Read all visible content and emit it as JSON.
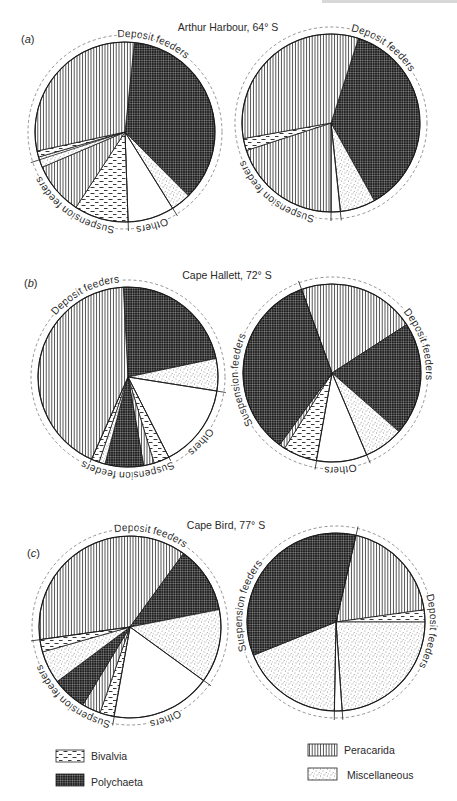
{
  "figure": {
    "panels": [
      {
        "id": "a",
        "label": {
          "open": "(",
          "letter": "a",
          "close": ")"
        },
        "title": "Arthur Harbour, 64° S"
      },
      {
        "id": "b",
        "label": {
          "open": "(",
          "letter": "b",
          "close": ")"
        },
        "title": "Cape Hallett, 72° S"
      },
      {
        "id": "c",
        "label": {
          "open": "(",
          "letter": "c",
          "close": ")"
        },
        "title": "Cape Bird, 77° S"
      }
    ]
  },
  "legend": {
    "items": [
      {
        "category": "Bivalvia",
        "label": "Bivalvia",
        "pattern": "dashes"
      },
      {
        "category": "Polychaeta",
        "label": "Polychaeta",
        "pattern": "dark-crosshatch"
      },
      {
        "category": "Peracarida",
        "label": "Peracarida",
        "pattern": "vertical-lines"
      },
      {
        "category": "Miscellaneous",
        "label": "Miscellaneous",
        "pattern": "stipple"
      }
    ],
    "unlabeled_categories": [
      {
        "category": "Others",
        "pattern": "blank"
      }
    ]
  },
  "chart_data": [
    {
      "type": "pie",
      "panel": "a",
      "title": "Arthur Harbour, 64° S",
      "legend": [
        "Bivalvia",
        "Polychaeta",
        "Peracarida",
        "Miscellaneous"
      ],
      "pies": [
        {
          "id": "a-left",
          "center": [
            125,
            132
          ],
          "radius": 90,
          "start_angle_deg": 6,
          "slices": [
            {
              "category": "Polychaeta",
              "value": 35.8
            },
            {
              "category": "Miscellaneous",
              "value": 3.6
            },
            {
              "category": "Others",
              "value": 8.3
            },
            {
              "category": "Bivalvia",
              "value": 9.7
            },
            {
              "category": "Peracarida",
              "value": 9.4
            },
            {
              "category": "Miscellaneous",
              "value": 1.9
            },
            {
              "category": "Bivalvia",
              "value": 1.1
            },
            {
              "category": "Peracarida",
              "value": 30.0
            }
          ],
          "group_labels": [
            {
              "text": "Deposit feeders",
              "mid_angle_deg": 17
            },
            {
              "text": "Others",
              "mid_angle_deg": 163
            },
            {
              "text": "Suspension feeders",
              "mid_angle_deg": 214
            }
          ],
          "dividers_deg": [
            148,
            178,
            252
          ]
        },
        {
          "id": "a-right",
          "center": [
            331,
            123
          ],
          "radius": 89,
          "start_angle_deg": 18,
          "slices": [
            {
              "category": "Polychaeta",
              "value": 36.9
            },
            {
              "category": "Miscellaneous",
              "value": 6.4
            },
            {
              "category": "Others",
              "value": 1.7
            },
            {
              "category": "Peracarida",
              "value": 20.0
            },
            {
              "category": "Bivalvia",
              "value": 2.2
            },
            {
              "category": "Peracarida",
              "value": 32.8
            }
          ],
          "group_labels": [
            {
              "text": "Deposit feeders",
              "mid_angle_deg": 34
            },
            {
              "text": "Suspension feeders",
              "mid_angle_deg": 218
            }
          ],
          "dividers_deg": [
            174,
            180
          ]
        }
      ]
    },
    {
      "type": "pie",
      "panel": "b",
      "title": "Cape Hallett, 72° S",
      "legend": [
        "Bivalvia",
        "Polychaeta",
        "Peracarida",
        "Miscellaneous"
      ],
      "pies": [
        {
          "id": "b-left",
          "center": [
            128,
            377
          ],
          "radius": 90,
          "start_angle_deg": -3,
          "slices": [
            {
              "category": "Polychaeta",
              "value": 22.5
            },
            {
              "category": "Miscellaneous",
              "value": 5.8
            },
            {
              "category": "Others",
              "value": 15.0
            },
            {
              "category": "Bivalvia",
              "value": 2.8
            },
            {
              "category": "Peracarida",
              "value": 1.9
            },
            {
              "category": "Polychaeta",
              "value": 6.9
            },
            {
              "category": "Miscellaneous",
              "value": 1.1
            },
            {
              "category": "Bivalvia",
              "value": 1.4
            },
            {
              "category": "Peracarida",
              "value": 42.5
            }
          ],
          "group_labels": [
            {
              "text": "Deposit feeders",
              "mid_angle_deg": 332
            },
            {
              "text": "Others",
              "mid_angle_deg": 131
            },
            {
              "text": "Suspension feeders",
              "mid_angle_deg": 180
            }
          ],
          "dividers_deg": [
            99,
            153,
            204
          ]
        },
        {
          "id": "b-right",
          "center": [
            332,
            373
          ],
          "radius": 89,
          "start_angle_deg": -20,
          "slices": [
            {
              "category": "Peracarida",
              "value": 21.4
            },
            {
              "category": "Polychaeta",
              "value": 20.6
            },
            {
              "category": "Miscellaneous",
              "value": 7.2
            },
            {
              "category": "Others",
              "value": 9.2
            },
            {
              "category": "Bivalvia",
              "value": 6.1
            },
            {
              "category": "Peracarida",
              "value": 1.1
            },
            {
              "category": "Polychaeta",
              "value": 34.4
            }
          ],
          "group_labels": [
            {
              "text": "Deposit feeders",
              "mid_angle_deg": 71
            },
            {
              "text": "Others",
              "mid_angle_deg": 174
            },
            {
              "text": "Suspension feeders",
              "mid_angle_deg": 265
            }
          ],
          "dividers_deg": [
            -20,
            157,
            190
          ]
        }
      ]
    },
    {
      "type": "pie",
      "panel": "c",
      "title": "Cape Bird, 77° S",
      "legend": [
        "Bivalvia",
        "Polychaeta",
        "Peracarida",
        "Miscellaneous"
      ],
      "pies": [
        {
          "id": "c-left",
          "center": [
            130,
            627
          ],
          "radius": 91,
          "start_angle_deg": -98,
          "slices": [
            {
              "category": "Peracarida",
              "value": 37.2
            },
            {
              "category": "Polychaeta",
              "value": 11.9
            },
            {
              "category": "Miscellaneous",
              "value": 13.1
            },
            {
              "category": "Others",
              "value": 17.8
            },
            {
              "category": "Bivalvia",
              "value": 2.5
            },
            {
              "category": "Peracarida",
              "value": 3.3
            },
            {
              "category": "Polychaeta",
              "value": 6.1
            },
            {
              "category": "Miscellaneous",
              "value": 5.8
            },
            {
              "category": "Bivalvia",
              "value": 2.2
            }
          ],
          "group_labels": [
            {
              "text": "Deposit feeders",
              "mid_angle_deg": 12
            },
            {
              "text": "Others",
              "mid_angle_deg": 158
            },
            {
              "text": "Suspension feeders",
              "mid_angle_deg": 219
            }
          ],
          "dividers_deg": [
            126,
            190,
            -98
          ]
        },
        {
          "id": "c-right",
          "center": [
            336,
            622
          ],
          "radius": 89,
          "start_angle_deg": 13,
          "slices": [
            {
              "category": "Peracarida",
              "value": 19.2
            },
            {
              "category": "Bivalvia",
              "value": 2.2
            },
            {
              "category": "Miscellaneous",
              "value": 23.9
            },
            {
              "category": "Others",
              "value": 1.4
            },
            {
              "category": "Miscellaneous",
              "value": 18.6
            },
            {
              "category": "Polychaeta",
              "value": 34.7
            }
          ],
          "group_labels": [
            {
              "text": "Deposit feeders",
              "mid_angle_deg": 95
            },
            {
              "text": "Suspension feeders",
              "mid_angle_deg": 280
            }
          ],
          "dividers_deg": [
            13,
            176,
            181
          ]
        }
      ]
    }
  ]
}
